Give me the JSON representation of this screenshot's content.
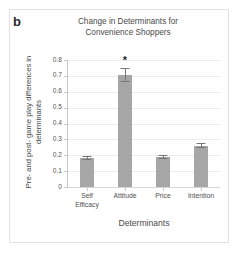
{
  "panel": {
    "label": "b"
  },
  "chart_data": {
    "type": "bar",
    "title": "Change in Determinants for Convenience Shoppers",
    "title_lines": [
      "Change in Determinants for",
      "Convenience Shoppers"
    ],
    "xlabel": "Determinants",
    "ylabel": "Pre- and post- game play differences in determinants",
    "ylabel_lines": [
      "Pre- and post- game play differences in",
      "determinants"
    ],
    "categories": [
      "Self Efficacy",
      "Attitude",
      "Price",
      "Intention"
    ],
    "category_lines": [
      [
        "Self",
        "Efficacy"
      ],
      [
        "Attitude"
      ],
      [
        "Price"
      ],
      [
        "Intention"
      ]
    ],
    "values": [
      0.185,
      0.705,
      0.19,
      0.26
    ],
    "errors": [
      0.012,
      0.042,
      0.013,
      0.016
    ],
    "ylim": [
      0,
      0.8
    ],
    "ytick_labels": [
      "0.8",
      "0.7",
      "0.6",
      "0.5",
      "0.4",
      "0.3",
      "0.2",
      "0.1",
      "0"
    ],
    "ytick_values": [
      0.8,
      0.7,
      0.6,
      0.5,
      0.4,
      0.3,
      0.2,
      0.1,
      0
    ],
    "grid": true,
    "legend": "none",
    "annotations": [
      {
        "text": "*",
        "category": "Attitude",
        "meaning": "significance-marker"
      }
    ],
    "bar_color": "#a6a6a6",
    "error_color": "#767676",
    "grid_color": "#ececec",
    "axis_color": "#c9c9c9"
  }
}
